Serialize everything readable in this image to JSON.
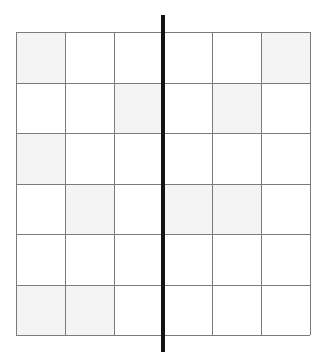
{
  "figure": {
    "title": "",
    "canvas": {
      "width": 326,
      "height": 358,
      "background": "#ffffff"
    }
  },
  "chart_data": {
    "type": "heatmap",
    "title": "",
    "subtitle": "",
    "xlabel": "",
    "ylabel": "",
    "grid": true,
    "legend": "none",
    "rows": 6,
    "columns": 6,
    "categories": [
      "1",
      "2",
      "3",
      "4",
      "5",
      "6"
    ],
    "row_labels": [
      "1",
      "2",
      "3",
      "4",
      "5",
      "6"
    ],
    "column_labels": [
      "1",
      "2",
      "3",
      "4",
      "5",
      "6"
    ],
    "values": [
      [
        1,
        0,
        0,
        0,
        0,
        1
      ],
      [
        0,
        0,
        1,
        0,
        1,
        0
      ],
      [
        1,
        0,
        0,
        0,
        0,
        0
      ],
      [
        0,
        1,
        0,
        1,
        1,
        0
      ],
      [
        0,
        0,
        0,
        0,
        0,
        0
      ],
      [
        1,
        1,
        0,
        0,
        0,
        0
      ]
    ],
    "value_colors": {
      "0": "#ffffff",
      "1": "#f4f4f4"
    },
    "annotations": [
      {
        "name": "vertical-divider",
        "type": "vline",
        "x": 3,
        "color": "#121212",
        "linewidth": 4.5,
        "extends_beyond_axes": true
      }
    ],
    "axis_ranges": {
      "x": [
        0,
        6
      ],
      "y": [
        0,
        6
      ]
    }
  },
  "geometry": {
    "grid_left": 16,
    "grid_top": 32,
    "grid_right": 310,
    "grid_bottom": 335,
    "cell_width": 49,
    "cell_height": 50.5,
    "gridline_color": "#7b7b7b",
    "gridline_width": 1,
    "divider_x": 163,
    "divider_top": 15,
    "divider_bottom": 352,
    "divider_width": 4.5
  }
}
